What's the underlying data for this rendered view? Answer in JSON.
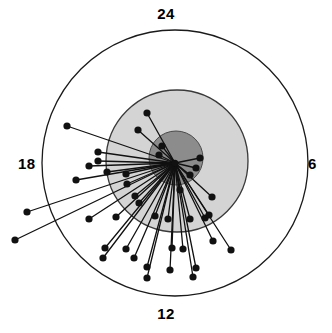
{
  "figure": {
    "type": "polar-clock-scatter",
    "width": 332,
    "height": 333,
    "background": "#ffffff"
  },
  "axis_labels": {
    "top": "24",
    "right": "6",
    "bottom": "12",
    "left": "18"
  },
  "chart_data": {
    "type": "scatter",
    "title": "",
    "subtitle": "",
    "xlabel": "",
    "ylabel": "",
    "coordinate_system": "polar",
    "angular_unit": "hours",
    "angular_range": [
      0,
      24
    ],
    "angular_tick_labels": [
      "24",
      "6",
      "12",
      "18"
    ],
    "angular_tick_values": [
      24,
      6,
      12,
      18
    ],
    "angular_tick_positions": [
      "top",
      "right",
      "bottom",
      "left"
    ],
    "angular_direction": "clockwise",
    "grid": false,
    "legend": null,
    "center": {
      "x": 175,
      "y": 163
    },
    "rings": [
      {
        "name": "outer-boundary-circle",
        "radius": 133,
        "fill": "#ffffff",
        "stroke": "#1a1a1a",
        "stroke_width": 1.3
      },
      {
        "name": "mid-shaded-circle",
        "radius": 71,
        "fill": "#d4d4d4",
        "stroke": "#3a3a3a",
        "stroke_width": 1.3,
        "center": {
          "x": 177,
          "y": 161
        }
      },
      {
        "name": "inner-shaded-circle",
        "radius": 27,
        "fill": "#8c8c8c",
        "stroke": "#4a4a4a",
        "stroke_width": 1.0,
        "center": {
          "x": 176,
          "y": 158
        }
      }
    ],
    "marker": {
      "shape": "circle",
      "size": 4.6,
      "color": "#111111"
    },
    "line": {
      "color": "#111111",
      "width": 1.3
    },
    "points": [
      {
        "x": 147,
        "y": 113
      },
      {
        "x": 138,
        "y": 130
      },
      {
        "x": 67,
        "y": 126
      },
      {
        "x": 98,
        "y": 152
      },
      {
        "x": 98,
        "y": 161
      },
      {
        "x": 89,
        "y": 166
      },
      {
        "x": 76,
        "y": 180
      },
      {
        "x": 107,
        "y": 172
      },
      {
        "x": 27,
        "y": 212
      },
      {
        "x": 15,
        "y": 240
      },
      {
        "x": 126,
        "y": 174
      },
      {
        "x": 127,
        "y": 184
      },
      {
        "x": 135,
        "y": 196
      },
      {
        "x": 139,
        "y": 203
      },
      {
        "x": 89,
        "y": 219
      },
      {
        "x": 116,
        "y": 217
      },
      {
        "x": 105,
        "y": 248
      },
      {
        "x": 103,
        "y": 258
      },
      {
        "x": 126,
        "y": 249
      },
      {
        "x": 134,
        "y": 258
      },
      {
        "x": 147,
        "y": 267
      },
      {
        "x": 147,
        "y": 278
      },
      {
        "x": 155,
        "y": 216
      },
      {
        "x": 168,
        "y": 219
      },
      {
        "x": 170,
        "y": 270
      },
      {
        "x": 172,
        "y": 248
      },
      {
        "x": 183,
        "y": 249
      },
      {
        "x": 190,
        "y": 219
      },
      {
        "x": 193,
        "y": 277
      },
      {
        "x": 196,
        "y": 268
      },
      {
        "x": 205,
        "y": 218
      },
      {
        "x": 209,
        "y": 215
      },
      {
        "x": 213,
        "y": 241
      },
      {
        "x": 231,
        "y": 250
      },
      {
        "x": 212,
        "y": 197
      },
      {
        "x": 196,
        "y": 168
      },
      {
        "x": 190,
        "y": 175
      },
      {
        "x": 200,
        "y": 158
      },
      {
        "x": 180,
        "y": 190
      },
      {
        "x": 159,
        "y": 155
      },
      {
        "x": 162,
        "y": 146
      }
    ]
  }
}
